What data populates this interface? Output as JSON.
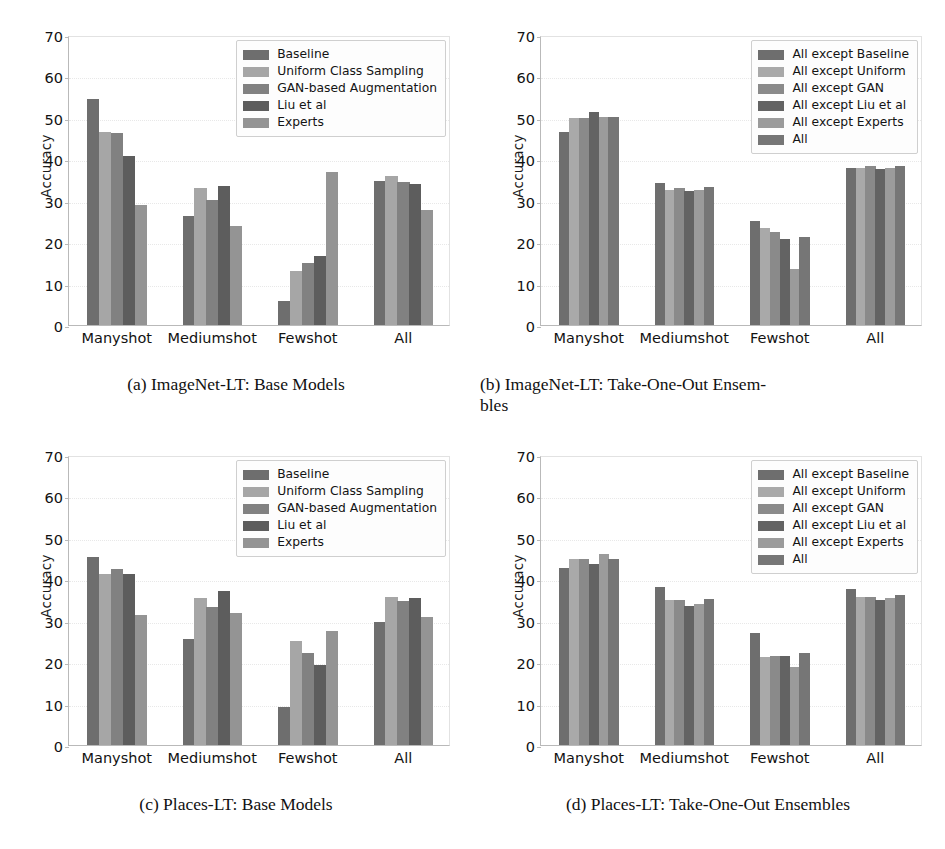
{
  "figure": {
    "top_partial_text": "",
    "axis": {
      "ylabel": "Accuracy",
      "yticks": [
        0,
        10,
        20,
        30,
        40,
        50,
        60,
        70
      ],
      "ylim": [
        0,
        70
      ],
      "categories": [
        "Manyshot",
        "Mediumshot",
        "Fewshot",
        "All"
      ]
    },
    "colors": {
      "series_grays": [
        "#6e6e6e",
        "#a6a6a6",
        "#818181",
        "#5d5d5d",
        "#949494"
      ],
      "ensemble_grays": [
        "#6e6e6e",
        "#a9a9a9",
        "#8a8a8a",
        "#636363",
        "#9b9b9b",
        "#767676"
      ],
      "axis_line": "#b9b9b9",
      "grid": "#e8e8e8",
      "text": "#121212",
      "legend_bg": "#fdfdfd",
      "legend_border": "#cfcfcf"
    }
  },
  "panels": [
    {
      "id": "a",
      "caption": "(a) ImageNet-LT: Base Models",
      "caption_line2": "",
      "legend_position": "top-right",
      "chart_data": {
        "type": "bar",
        "title": "ImageNet-LT: Base Models",
        "xlabel": "",
        "ylabel": "Accuracy",
        "ylim": [
          0,
          70
        ],
        "yticks": [
          0,
          10,
          20,
          30,
          40,
          50,
          60,
          70
        ],
        "grid": true,
        "legend_position": "upper right",
        "categories": [
          "Manyshot",
          "Mediumshot",
          "Fewshot",
          "All"
        ],
        "series": [
          {
            "name": "Baseline",
            "values": [
              54.5,
              26.4,
              5.9,
              34.7
            ]
          },
          {
            "name": "Uniform Class Sampling",
            "values": [
              46.5,
              33.0,
              13.0,
              35.9
            ]
          },
          {
            "name": "GAN-based Augmentation",
            "values": [
              46.4,
              30.1,
              14.9,
              34.5
            ]
          },
          {
            "name": "Liu et al",
            "values": [
              40.9,
              33.5,
              16.6,
              34.0
            ]
          },
          {
            "name": "Experts",
            "values": [
              28.9,
              24.0,
              37.0,
              27.8
            ]
          }
        ]
      }
    },
    {
      "id": "b",
      "caption": "(b) ImageNet-LT: Take-One-Out Ensem-",
      "caption_line2": "bles",
      "legend_position": "top-right",
      "chart_data": {
        "type": "bar",
        "title": "ImageNet-LT: Take-One-Out Ensembles",
        "xlabel": "",
        "ylabel": "Accuracy",
        "ylim": [
          0,
          70
        ],
        "yticks": [
          0,
          10,
          20,
          30,
          40,
          50,
          60,
          70
        ],
        "grid": true,
        "legend_position": "upper right",
        "categories": [
          "Manyshot",
          "Mediumshot",
          "Fewshot",
          "All"
        ],
        "series": [
          {
            "name": "All except Baseline",
            "values": [
              46.6,
              34.4,
              25.0,
              37.8
            ]
          },
          {
            "name": "All except Uniform",
            "values": [
              50.0,
              32.5,
              23.5,
              37.9
            ]
          },
          {
            "name": "All except GAN",
            "values": [
              50.0,
              33.0,
              22.4,
              38.4
            ]
          },
          {
            "name": "All except Liu et al",
            "values": [
              51.5,
              32.4,
              20.8,
              37.7
            ]
          },
          {
            "name": "All except Experts",
            "values": [
              50.1,
              32.6,
              13.5,
              37.9
            ]
          },
          {
            "name": "All",
            "values": [
              50.2,
              33.3,
              21.3,
              38.4
            ]
          }
        ]
      }
    },
    {
      "id": "c",
      "caption": "(c) Places-LT: Base Models",
      "caption_line2": "",
      "legend_position": "top-right",
      "chart_data": {
        "type": "bar",
        "title": "Places-LT: Base Models",
        "xlabel": "",
        "ylabel": "Accuracy",
        "ylim": [
          0,
          70
        ],
        "yticks": [
          0,
          10,
          20,
          30,
          40,
          50,
          60,
          70
        ],
        "grid": true,
        "legend_position": "upper right",
        "categories": [
          "Manyshot",
          "Mediumshot",
          "Fewshot",
          "All"
        ],
        "series": [
          {
            "name": "Baseline",
            "values": [
              45.5,
              25.6,
              9.1,
              29.6
            ]
          },
          {
            "name": "Uniform Class Sampling",
            "values": [
              41.3,
              35.5,
              25.2,
              35.8
            ]
          },
          {
            "name": "GAN-based Augmentation",
            "values": [
              42.6,
              33.4,
              22.3,
              34.8
            ]
          },
          {
            "name": "Liu et al",
            "values": [
              41.2,
              37.2,
              19.3,
              35.4
            ]
          },
          {
            "name": "Experts",
            "values": [
              31.3,
              31.8,
              27.6,
              30.8
            ]
          }
        ]
      }
    },
    {
      "id": "d",
      "caption": "(d) Places-LT: Take-One-Out Ensembles",
      "caption_line2": "",
      "legend_position": "top-right",
      "chart_data": {
        "type": "bar",
        "title": "Places-LT: Take-One-Out Ensembles",
        "xlabel": "",
        "ylabel": "Accuracy",
        "ylim": [
          0,
          70
        ],
        "yticks": [
          0,
          10,
          20,
          30,
          40,
          50,
          60,
          70
        ],
        "grid": true,
        "legend_position": "upper right",
        "categories": [
          "Manyshot",
          "Mediumshot",
          "Fewshot",
          "All"
        ],
        "series": [
          {
            "name": "All except Baseline",
            "values": [
              42.8,
              38.1,
              27.0,
              37.6
            ]
          },
          {
            "name": "All except Uniform",
            "values": [
              44.9,
              34.9,
              21.3,
              35.7
            ]
          },
          {
            "name": "All except GAN",
            "values": [
              44.8,
              34.9,
              21.6,
              35.8
            ]
          },
          {
            "name": "All except Liu et al",
            "values": [
              43.8,
              33.5,
              21.5,
              35.0
            ]
          },
          {
            "name": "All except Experts",
            "values": [
              46.1,
              34.1,
              18.8,
              35.4
            ]
          },
          {
            "name": "All",
            "values": [
              45.0,
              35.3,
              22.3,
              36.1
            ]
          }
        ]
      }
    }
  ]
}
